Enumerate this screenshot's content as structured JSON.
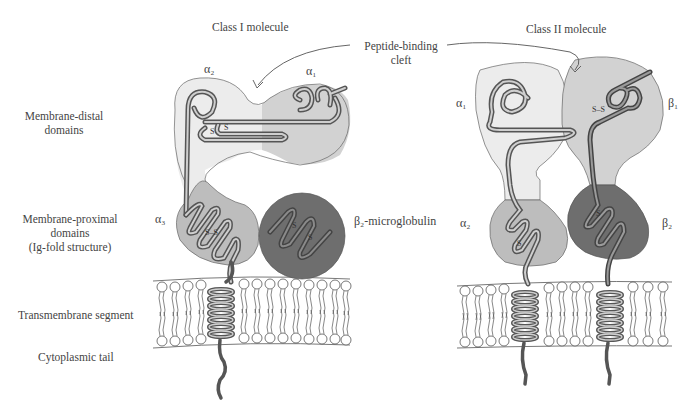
{
  "titles": {
    "class1": "Class I molecule",
    "class2": "Class II molecule"
  },
  "cleft_label": {
    "line1": "Peptide-binding",
    "line2": "cleft"
  },
  "row_labels": {
    "distal_line1": "Membrane-distal",
    "distal_line2": "domains",
    "proximal_line1": "Membrane-proximal",
    "proximal_line2": "domains",
    "proximal_line3": "(Ig-fold structure)",
    "transmembrane": "Transmembrane segment",
    "cytoplasmic": "Cytoplasmic tail"
  },
  "class1_domains": {
    "alpha2": "α₂",
    "alpha1": "α₁",
    "alpha3": "α₃",
    "b2m": "β₂-microglobulin"
  },
  "class2_domains": {
    "alpha1": "α₁",
    "beta1": "β₁",
    "alpha2": "α₂",
    "beta2": "β₂"
  },
  "disulfide": "S–S",
  "colors": {
    "lightest": "#ececec",
    "light": "#d2d2d2",
    "mid": "#bdbdbd",
    "dark": "#6e6e6e",
    "chain": "#6a6a6a",
    "outline": "#555555"
  }
}
